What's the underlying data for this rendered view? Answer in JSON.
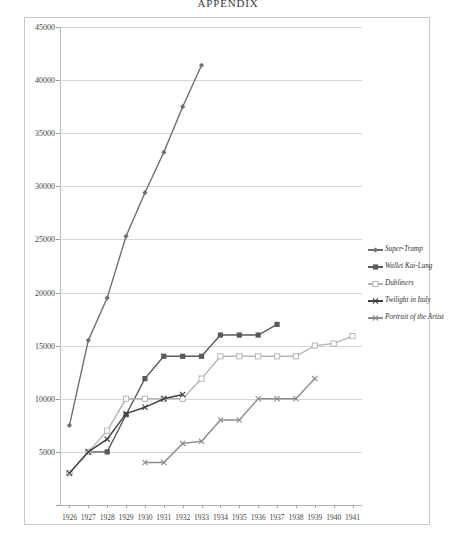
{
  "document": {
    "title": "APPENDIX"
  },
  "chart_data": {
    "type": "line",
    "title": "APPENDIX",
    "xlabel": "",
    "ylabel": "",
    "grid": true,
    "legend_position": "right",
    "x": [
      1926,
      1927,
      1928,
      1929,
      1930,
      1931,
      1932,
      1933,
      1934,
      1935,
      1936,
      1937,
      1938,
      1939,
      1940,
      1941
    ],
    "categories": [
      "1926",
      "1927",
      "1928",
      "1929",
      "1930",
      "1931",
      "1932",
      "1933",
      "1934",
      "1935",
      "1936",
      "1937",
      "1938",
      "1939",
      "1940",
      "1941"
    ],
    "ylim": [
      0,
      45000
    ],
    "yticks": [
      0,
      5000,
      10000,
      15000,
      20000,
      25000,
      30000,
      35000,
      40000,
      45000
    ],
    "ytick_labels": [
      "0",
      "5000",
      "10000",
      "15000",
      "20000",
      "25000",
      "30000",
      "35000",
      "40000",
      "45000"
    ],
    "series": [
      {
        "name": "Super-Tramp",
        "marker": "diamond",
        "color": "#6f6f6f",
        "x": [
          1926,
          1927,
          1928,
          1929,
          1930,
          1931,
          1932,
          1933
        ],
        "values": [
          7500,
          15500,
          19500,
          25300,
          29400,
          33200,
          37500,
          41400
        ]
      },
      {
        "name": "Wallet Kai-Lung",
        "marker": "square",
        "color": "#595959",
        "x": [
          1926,
          1927,
          1928,
          1929,
          1930,
          1931,
          1932,
          1933,
          1934,
          1935,
          1936,
          1937
        ],
        "values": [
          3000,
          5000,
          5000,
          8500,
          11900,
          14000,
          14000,
          14000,
          16000,
          16000,
          16000,
          17000
        ]
      },
      {
        "name": "Dubliners",
        "marker": "square-open",
        "color": "#b5b5b5",
        "x": [
          1926,
          1927,
          1928,
          1929,
          1930,
          1931,
          1932,
          1933,
          1934,
          1935,
          1936,
          1937,
          1938,
          1939,
          1940,
          1941
        ],
        "values": [
          3000,
          5000,
          7000,
          10000,
          10000,
          10000,
          10000,
          11900,
          14000,
          14000,
          14000,
          14000,
          14000,
          15000,
          15200,
          15900
        ]
      },
      {
        "name": "Twilight in Italy",
        "marker": "x",
        "color": "#404040",
        "x": [
          1926,
          1927,
          1928,
          1929,
          1930,
          1931,
          1932
        ],
        "values": [
          3000,
          5000,
          6200,
          8600,
          9200,
          10000,
          10400
        ]
      },
      {
        "name": "Portrait of the Artist",
        "marker": "x",
        "color": "#8c8c8c",
        "x": [
          1930,
          1931,
          1932,
          1933,
          1934,
          1935,
          1936,
          1937,
          1938,
          1939
        ],
        "values": [
          4000,
          4000,
          5800,
          6000,
          8000,
          8000,
          10000,
          10000,
          10000,
          11900
        ]
      }
    ]
  },
  "legend": {
    "items": [
      {
        "label": "Super-Tramp"
      },
      {
        "label": "Wallet Kai-Lung"
      },
      {
        "label": "Dubliners"
      },
      {
        "label": "Twilight in Italy"
      },
      {
        "label": "Portrait of the Artist"
      }
    ]
  }
}
